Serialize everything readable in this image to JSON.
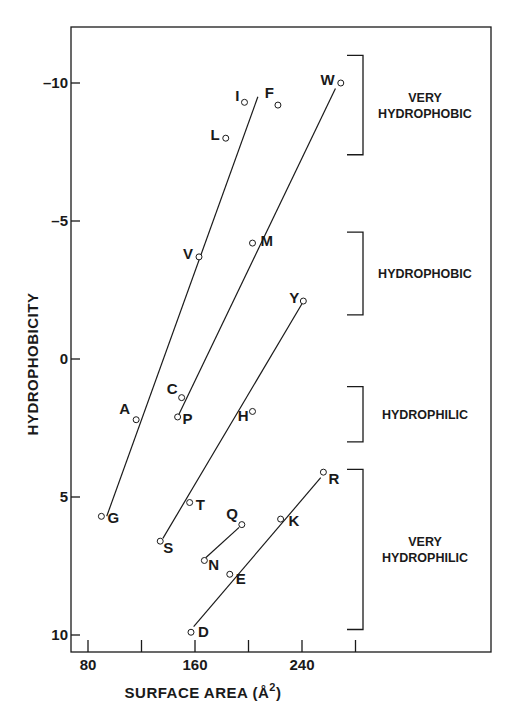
{
  "chart_data": {
    "type": "scatter",
    "title": "",
    "xlabel": "SURFACE AREA (Å²)",
    "xlabel_parts": {
      "main": "SURFACE AREA (Å",
      "sup": "2",
      "close": ")"
    },
    "ylabel": "HYDROPHOBICITY",
    "xlim": [
      72,
      320
    ],
    "ylim": [
      -12.0,
      10.7
    ],
    "y_inverted": true,
    "grid": false,
    "legend": "none",
    "x_ticks": [
      80,
      120,
      160,
      200,
      240,
      280
    ],
    "x_tick_labels": [
      "80",
      "",
      "160",
      "",
      "240",
      ""
    ],
    "y_ticks": [
      -10,
      -5,
      0,
      5,
      10
    ],
    "y_tick_labels": [
      "-10",
      "-5",
      "0",
      "5",
      "10"
    ],
    "points": [
      {
        "label": "G",
        "x": 90,
        "y": 5.7
      },
      {
        "label": "A",
        "x": 116,
        "y": 2.2
      },
      {
        "label": "V",
        "x": 163,
        "y": -3.7
      },
      {
        "label": "L",
        "x": 183,
        "y": -8.0
      },
      {
        "label": "I",
        "x": 197,
        "y": -9.3
      },
      {
        "label": "F",
        "x": 222,
        "y": -9.2
      },
      {
        "label": "W",
        "x": 269,
        "y": -10.0
      },
      {
        "label": "M",
        "x": 203,
        "y": -4.2
      },
      {
        "label": "C",
        "x": 150,
        "y": 1.4
      },
      {
        "label": "P",
        "x": 147,
        "y": 2.1
      },
      {
        "label": "Y",
        "x": 241,
        "y": -2.1
      },
      {
        "label": "H",
        "x": 203,
        "y": 1.9
      },
      {
        "label": "T",
        "x": 156,
        "y": 5.2
      },
      {
        "label": "S",
        "x": 134,
        "y": 6.6
      },
      {
        "label": "Q",
        "x": 195,
        "y": 6.0
      },
      {
        "label": "N",
        "x": 167,
        "y": 7.3
      },
      {
        "label": "E",
        "x": 186,
        "y": 7.8
      },
      {
        "label": "K",
        "x": 224,
        "y": 5.8
      },
      {
        "label": "R",
        "x": 256,
        "y": 4.1
      },
      {
        "label": "D",
        "x": 157,
        "y": 9.9
      }
    ],
    "fit_lines": [
      {
        "name": "line-G-A-V-I",
        "from": {
          "x": 94,
          "y": 5.7
        },
        "to": {
          "x": 207,
          "y": -9.5
        }
      },
      {
        "name": "line-P-C-M-W",
        "from": {
          "x": 148,
          "y": 2.0
        },
        "to": {
          "x": 265,
          "y": -9.8
        }
      },
      {
        "name": "line-S-T-H-Y",
        "from": {
          "x": 136,
          "y": 6.5
        },
        "to": {
          "x": 240,
          "y": -2.0
        }
      },
      {
        "name": "line-N-Q",
        "from": {
          "x": 168,
          "y": 7.2
        },
        "to": {
          "x": 193,
          "y": 6.1
        }
      },
      {
        "name": "line-D-E-K-R",
        "from": {
          "x": 159,
          "y": 9.7
        },
        "to": {
          "x": 254,
          "y": 4.3
        }
      }
    ],
    "annotations": [
      {
        "text": "VERY HYDROPHOBIC",
        "lines": [
          "VERY",
          "HYDROPHOBIC"
        ],
        "bracket_y_range": [
          -11.0,
          -7.4
        ]
      },
      {
        "text": "HYDROPHOBIC",
        "lines": [
          "HYDROPHOBIC"
        ],
        "bracket_y_range": [
          -4.6,
          -1.6
        ]
      },
      {
        "text": "HYDROPHILIC",
        "lines": [
          "HYDROPHILIC"
        ],
        "bracket_y_range": [
          1.0,
          3.0
        ]
      },
      {
        "text": "VERY HYDROPHILIC",
        "lines": [
          "VERY",
          "HYDROPHILIC"
        ],
        "bracket_y_range": [
          4.0,
          9.8
        ]
      }
    ]
  },
  "layout": {
    "plot_left": 71,
    "plot_right": 491,
    "plot_top": 27,
    "plot_bottom": 652,
    "px_x0": 88,
    "px_x_per_unit": 1.3375,
    "px_y0": 359,
    "px_y_per_unit": 27.6
  },
  "colors": {
    "ink": "#1a1a1a",
    "background": "#ffffff"
  }
}
